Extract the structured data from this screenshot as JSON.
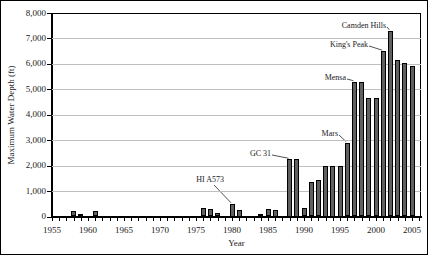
{
  "chart_data": {
    "type": "bar",
    "title": "",
    "xlabel": "Year",
    "ylabel": "Maximum Water Depth (ft)",
    "x_axis": {
      "min": 1955,
      "max": 2006,
      "labeled_ticks": [
        "1955",
        "1960",
        "1965",
        "1970",
        "1975",
        "1980",
        "1985",
        "1990",
        "1995",
        "2000",
        "2005"
      ],
      "minor_tick_every_years": 1
    },
    "y_axis": {
      "min": 0,
      "max": 8000,
      "tick_interval": 1000,
      "tick_labels": [
        "0",
        "1,000",
        "2,000",
        "3,000",
        "4,000",
        "5,000",
        "6,000",
        "7,000",
        "8,000"
      ],
      "grid": true
    },
    "legend": "none",
    "series": [
      {
        "name": "Maximum Water Depth (ft)",
        "points": [
          {
            "year": 1958,
            "value": 200
          },
          {
            "year": 1959,
            "value": 100
          },
          {
            "year": 1961,
            "value": 200
          },
          {
            "year": 1976,
            "value": 350
          },
          {
            "year": 1977,
            "value": 300
          },
          {
            "year": 1978,
            "value": 150
          },
          {
            "year": 1980,
            "value": 500
          },
          {
            "year": 1981,
            "value": 250
          },
          {
            "year": 1984,
            "value": 100
          },
          {
            "year": 1985,
            "value": 300
          },
          {
            "year": 1986,
            "value": 250
          },
          {
            "year": 1988,
            "value": 2250
          },
          {
            "year": 1989,
            "value": 2250
          },
          {
            "year": 1990,
            "value": 350
          },
          {
            "year": 1991,
            "value": 1350
          },
          {
            "year": 1992,
            "value": 1450
          },
          {
            "year": 1993,
            "value": 2000
          },
          {
            "year": 1994,
            "value": 2000
          },
          {
            "year": 1995,
            "value": 2000
          },
          {
            "year": 1996,
            "value": 2900
          },
          {
            "year": 1997,
            "value": 5300
          },
          {
            "year": 1998,
            "value": 5300
          },
          {
            "year": 1999,
            "value": 4650
          },
          {
            "year": 2000,
            "value": 4650
          },
          {
            "year": 2001,
            "value": 6500
          },
          {
            "year": 2002,
            "value": 7300
          },
          {
            "year": 2003,
            "value": 6150
          },
          {
            "year": 2004,
            "value": 6050
          },
          {
            "year": 2005,
            "value": 5900
          }
        ]
      }
    ],
    "annotations": [
      {
        "label": "Camden Hills",
        "target_year": 2002,
        "target_value": 7300,
        "lx": 385,
        "ly": 24,
        "sx": 386,
        "sy": 26
      },
      {
        "label": "King's Peak",
        "target_year": 2001,
        "target_value": 6500,
        "lx": 367,
        "ly": 43,
        "sx": 368,
        "sy": 45
      },
      {
        "label": "Mensa",
        "target_year": 1997,
        "target_value": 5300,
        "lx": 345,
        "ly": 76,
        "sx": 346,
        "sy": 78
      },
      {
        "label": "Mars",
        "target_year": 1996,
        "target_value": 2900,
        "lx": 337,
        "ly": 132,
        "sx": 338,
        "sy": 134
      },
      {
        "label": "GC 31",
        "target_year": 1988,
        "target_value": 2250,
        "lx": 270,
        "ly": 152,
        "sx": 271,
        "sy": 154
      },
      {
        "label": "HI A573",
        "target_year": 1980,
        "target_value": 500,
        "lx": 223,
        "ly": 178,
        "sx": 213,
        "sy": 184
      }
    ],
    "layout": {
      "plot_left": 51,
      "plot_top": 12,
      "plot_right": 420,
      "plot_bottom": 215.5,
      "px_per_year": 7.2,
      "bar_width": 5
    },
    "colors": {
      "background": "#ffffff",
      "bar_fill": "#606060",
      "bar_border": "#000000",
      "gridline": "#bfbfbf",
      "axis": "#000000",
      "text": "#1a1a1a"
    }
  }
}
